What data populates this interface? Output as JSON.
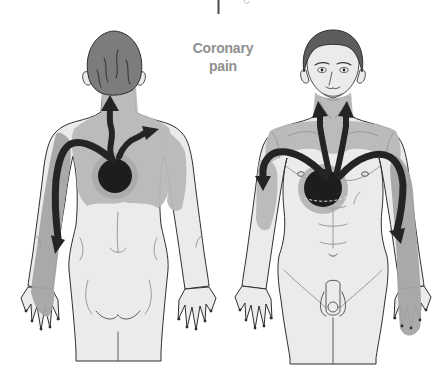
{
  "caption": {
    "line1": "Coronary",
    "line2": "pain"
  },
  "colors": {
    "background": "#ffffff",
    "caption_text": "#8f8f8f",
    "skin": "#ebebeb",
    "body_outline": "#2f2f2f",
    "detail_line": "#9b9b9b",
    "pain_shade": "#b9b9b9",
    "pain_shade_arm": "#a5a5a5",
    "pain_halo": "#a6a6a6",
    "arrow": "#242424",
    "heart": "#1d1d1d",
    "hair_back_view": "#7c7c7c",
    "hair_front_view": "#5d5d5d"
  }
}
